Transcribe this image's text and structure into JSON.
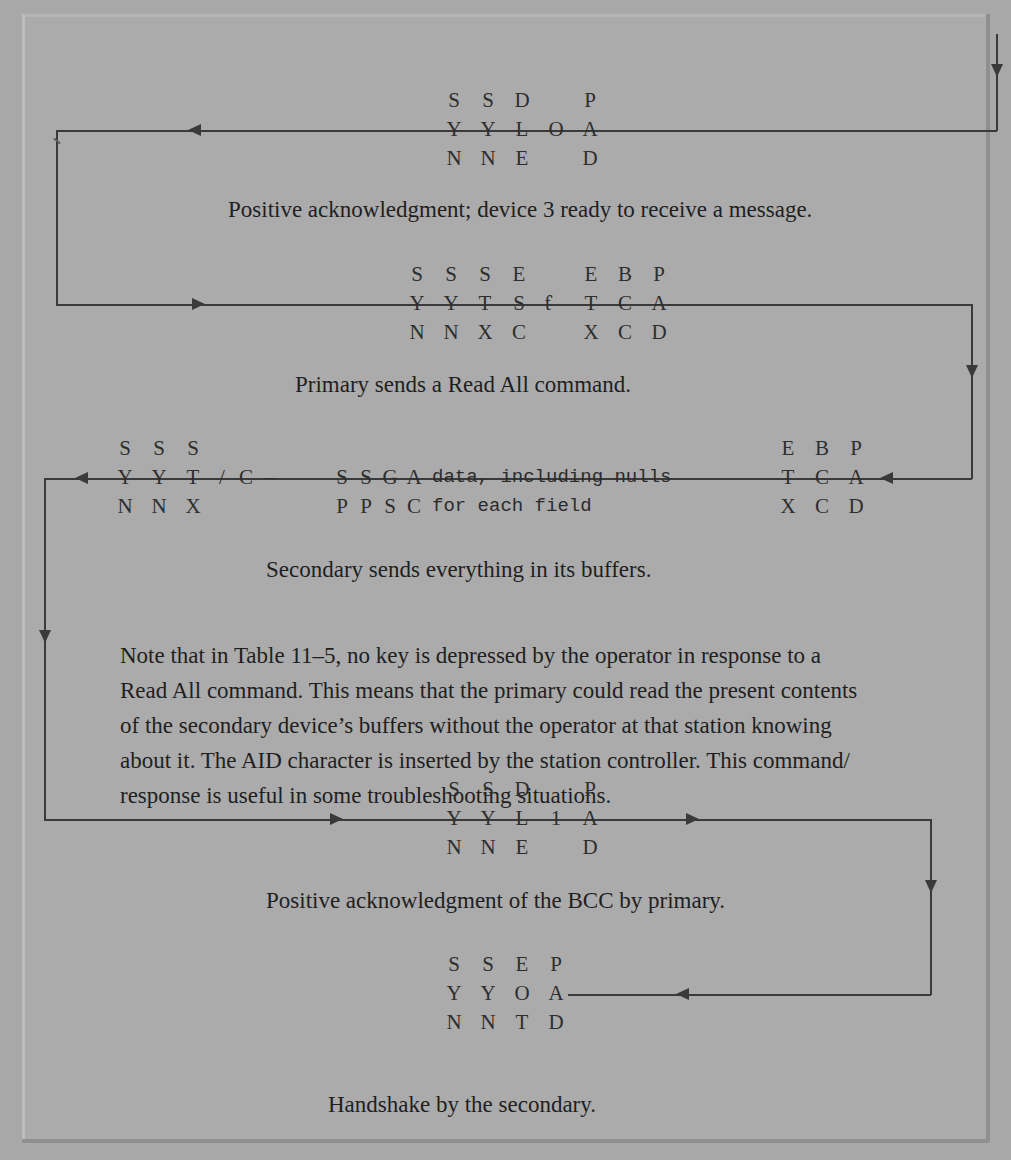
{
  "page": {
    "background_color": "#a8a8a8",
    "ink_color": "#2e2e2e"
  },
  "blocks": [
    {
      "id": "block-1-ack-dle0",
      "caption": "Positive acknowledgment; device 3 ready to receive a message.",
      "frames": [
        {
          "top": "S",
          "mid": "Y",
          "bot": "N"
        },
        {
          "top": "S",
          "mid": "Y",
          "bot": "N"
        },
        {
          "top": "D",
          "mid": "L",
          "bot": "E"
        },
        {
          "top": "",
          "mid": "O",
          "bot": ""
        },
        {
          "top": "P",
          "mid": "A",
          "bot": "D"
        }
      ]
    },
    {
      "id": "block-2-read-all",
      "caption": "Primary sends a Read All command.",
      "frames": [
        {
          "top": "S",
          "mid": "Y",
          "bot": "N"
        },
        {
          "top": "S",
          "mid": "Y",
          "bot": "N"
        },
        {
          "top": "S",
          "mid": "T",
          "bot": "X"
        },
        {
          "top": "E",
          "mid": "S",
          "bot": "C"
        },
        {
          "top": "",
          "mid": "ƭ",
          "bot": ""
        },
        {
          "top": "E",
          "mid": "T",
          "bot": "X"
        },
        {
          "top": "B",
          "mid": "C",
          "bot": "C"
        },
        {
          "top": "P",
          "mid": "A",
          "bot": "D"
        }
      ]
    },
    {
      "id": "block-3-secondary-data",
      "caption": "Secondary sends everything in its buffers.",
      "frames_left": [
        {
          "top": "S",
          "mid": "Y",
          "bot": "N"
        },
        {
          "top": "S",
          "mid": "Y",
          "bot": "N"
        },
        {
          "top": "S",
          "mid": "T",
          "bot": "X"
        },
        {
          "top": "",
          "mid": "/",
          "bot": ""
        },
        {
          "top": "",
          "mid": "C",
          "bot": ""
        },
        {
          "top": "",
          "mid": "–",
          "bot": ""
        }
      ],
      "frames_inner": [
        {
          "top": "S",
          "bot": "P"
        },
        {
          "top": "S",
          "bot": "P"
        },
        {
          "top": "G",
          "bot": "S"
        },
        {
          "top": "A",
          "bot": "C"
        }
      ],
      "payload_line_1": "data, including nulls",
      "payload_line_2": "for each field",
      "frames_right": [
        {
          "top": "E",
          "mid": "T",
          "bot": "X"
        },
        {
          "top": "B",
          "mid": "C",
          "bot": "C"
        },
        {
          "top": "P",
          "mid": "A",
          "bot": "D"
        }
      ]
    },
    {
      "id": "block-4-ack-dle1",
      "caption": "Positive acknowledgment of the BCC by primary.",
      "frames": [
        {
          "top": "S",
          "mid": "Y",
          "bot": "N"
        },
        {
          "top": "S",
          "mid": "Y",
          "bot": "N"
        },
        {
          "top": "D",
          "mid": "L",
          "bot": "E"
        },
        {
          "top": "",
          "mid": "1",
          "bot": ""
        },
        {
          "top": "P",
          "mid": "A",
          "bot": "D"
        }
      ]
    },
    {
      "id": "block-5-eot",
      "caption": "Handshake by the secondary.",
      "frames": [
        {
          "top": "S",
          "mid": "Y",
          "bot": "N"
        },
        {
          "top": "S",
          "mid": "Y",
          "bot": "N"
        },
        {
          "top": "E",
          "mid": "O",
          "bot": "T"
        },
        {
          "top": "P",
          "mid": "A",
          "bot": "D"
        }
      ]
    }
  ],
  "note_paragraph": {
    "lines": [
      "Note that in Table 11–5, no key is depressed by the operator in response to a",
      "Read All command. This means that the primary could read the present contents",
      "of the secondary device’s buffers without the operator at that station knowing",
      "about it. The AID character is inserted by the station controller. This command/",
      "response is useful in some troubleshooting situations."
    ]
  }
}
